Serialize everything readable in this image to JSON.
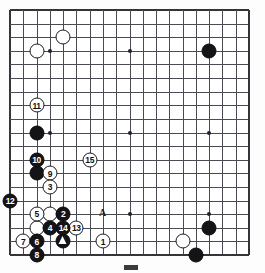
{
  "board": {
    "title": "Go board diagram",
    "size": 19,
    "cols": 19,
    "rows": 19,
    "star_points": [
      [
        3,
        3
      ],
      [
        9,
        3
      ],
      [
        15,
        3
      ],
      [
        3,
        9
      ],
      [
        9,
        9
      ],
      [
        15,
        9
      ],
      [
        3,
        15
      ],
      [
        9,
        15
      ],
      [
        15,
        15
      ]
    ],
    "colors": {
      "black": "#141418",
      "white": "#ffffff",
      "line": "#4a4a52",
      "edge": "#343439",
      "background": "#ffffff"
    }
  },
  "stones": [
    {
      "col": 2,
      "row": 3,
      "color": "white",
      "label": ""
    },
    {
      "col": 4,
      "row": 2,
      "color": "white",
      "label": ""
    },
    {
      "col": 15,
      "row": 3,
      "color": "black",
      "label": ""
    },
    {
      "col": 2,
      "row": 7,
      "color": "white",
      "label": "11"
    },
    {
      "col": 2,
      "row": 9,
      "color": "black",
      "label": ""
    },
    {
      "col": 2,
      "row": 11,
      "color": "black",
      "label": "10"
    },
    {
      "col": 2,
      "row": 12,
      "color": "black",
      "label": ""
    },
    {
      "col": 3,
      "row": 12,
      "color": "white",
      "label": "9"
    },
    {
      "col": 3,
      "row": 13,
      "color": "white",
      "label": "3"
    },
    {
      "col": 6,
      "row": 11,
      "color": "white",
      "label": "15"
    },
    {
      "col": 0,
      "row": 14,
      "color": "black",
      "label": "12"
    },
    {
      "col": 2,
      "row": 15,
      "color": "white",
      "label": "5"
    },
    {
      "col": 3,
      "row": 15,
      "color": "white",
      "label": ""
    },
    {
      "col": 4,
      "row": 15,
      "color": "black",
      "label": "2"
    },
    {
      "col": 2,
      "row": 16,
      "color": "white",
      "label": ""
    },
    {
      "col": 3,
      "row": 16,
      "color": "black",
      "label": "4"
    },
    {
      "col": 4,
      "row": 16,
      "color": "black",
      "label": "14"
    },
    {
      "col": 5,
      "row": 16,
      "color": "white",
      "label": "13"
    },
    {
      "col": 1,
      "row": 17,
      "color": "white",
      "label": "7"
    },
    {
      "col": 2,
      "row": 17,
      "color": "black",
      "label": "6"
    },
    {
      "col": 4,
      "row": 17,
      "color": "black",
      "label": ""
    },
    {
      "col": 2,
      "row": 18,
      "color": "black",
      "label": "8"
    },
    {
      "col": 7,
      "row": 17,
      "color": "white",
      "label": "1"
    },
    {
      "col": 15,
      "row": 16,
      "color": "black",
      "label": ""
    },
    {
      "col": 13,
      "row": 17,
      "color": "white",
      "label": ""
    },
    {
      "col": 14,
      "row": 18,
      "color": "black",
      "label": ""
    }
  ],
  "markers": [
    {
      "type": "triangle",
      "col": 4,
      "row": 17,
      "on_stone": true
    },
    {
      "type": "letter",
      "col": 7,
      "row": 15,
      "text": "A"
    }
  ],
  "caption": {
    "swatch_color": "#3a3a40",
    "text": ""
  }
}
